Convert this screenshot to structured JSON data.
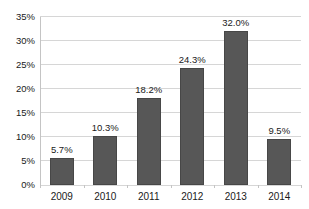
{
  "chart_data": {
    "type": "bar",
    "categories": [
      "2009",
      "2010",
      "2011",
      "2012",
      "2013",
      "2014"
    ],
    "values": [
      5.7,
      10.3,
      18.2,
      24.3,
      32.0,
      9.5
    ],
    "value_labels": [
      "5.7%",
      "10.3%",
      "18.2%",
      "24.3%",
      "32.0%",
      "9.5%"
    ],
    "y_ticks": [
      0,
      5,
      10,
      15,
      20,
      25,
      30,
      35
    ],
    "y_tick_labels": [
      "0%",
      "5%",
      "10%",
      "15%",
      "20%",
      "25%",
      "30%",
      "35%"
    ],
    "ylim": [
      0,
      35
    ],
    "title": "",
    "xlabel": "",
    "ylabel": "",
    "grid": true,
    "legend": false,
    "colors": {
      "bar_fill": "#575757",
      "bar_border": "#474747",
      "gridline": "#d6d6d6",
      "axis_line": "#c4c4c4",
      "text": "#1a1a1a",
      "background": "#ffffff"
    }
  }
}
